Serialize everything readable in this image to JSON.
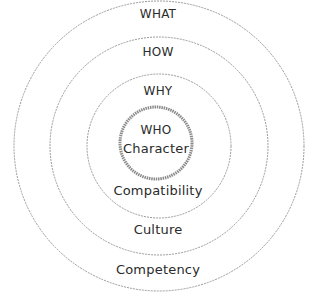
{
  "diagram": {
    "type": "concentric-circles",
    "rings": [
      {
        "outer_label": "WHAT",
        "inner_label": "Competency"
      },
      {
        "outer_label": "HOW",
        "inner_label": "Culture"
      },
      {
        "outer_label": "WHY",
        "inner_label": "Compatibility"
      }
    ],
    "core": {
      "title": "WHO",
      "subtitle": "Character"
    },
    "colors": {
      "ring_stroke": "#9a9a9a",
      "core_stroke": "#7a7a7a",
      "text": "#2a2a2a"
    }
  }
}
